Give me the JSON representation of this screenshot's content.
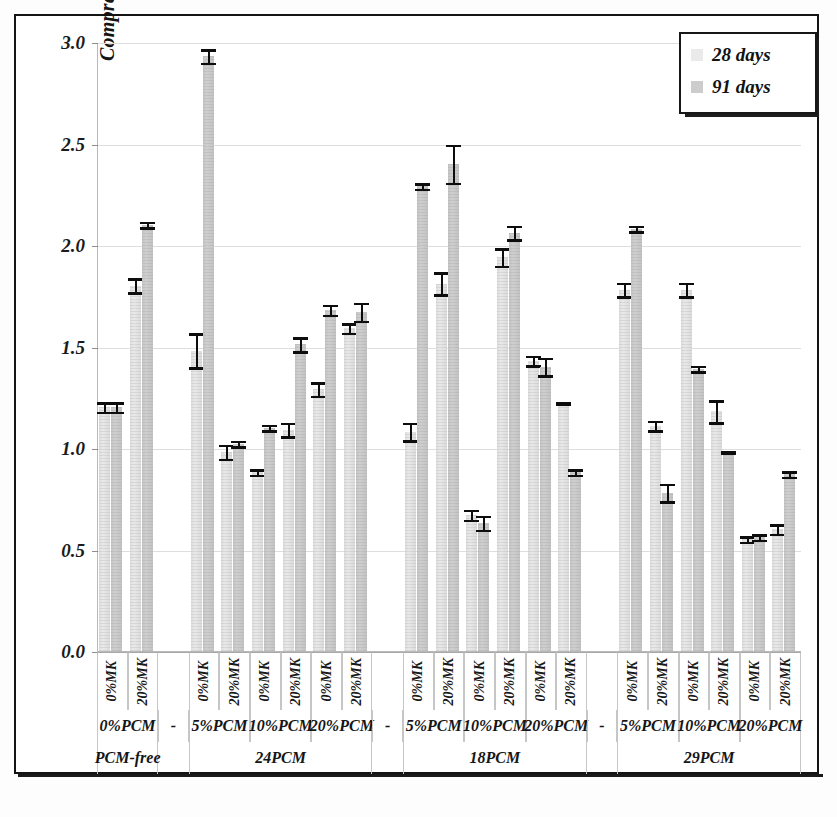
{
  "chart_data": {
    "type": "bar",
    "title": "",
    "xlabel": "",
    "ylabel": "Compresive strength (MPa)",
    "ylim": [
      0.0,
      3.0
    ],
    "ytick_labels": [
      "3.0",
      "2.5",
      "2.0",
      "1.5",
      "1.0",
      "0.5",
      "0.0"
    ],
    "ytick_values": [
      3.0,
      2.5,
      2.0,
      1.5,
      1.0,
      0.5,
      0.0
    ],
    "grid": true,
    "legend_position": "top-right",
    "legend": [
      {
        "name": "28 days",
        "color": "#eaeaea"
      },
      {
        "name": "91 days",
        "color": "#cccccc"
      }
    ],
    "groups": [
      {
        "name": "PCM-free",
        "pcm_levels": [
          {
            "label": "0%PCM",
            "columns": [
              {
                "mk": "0%MK",
                "d28": 1.2,
                "d28_err": 0.03,
                "d91": 1.2,
                "d91_err": 0.03
              },
              {
                "mk": "20%MK",
                "d28": 1.8,
                "d28_err": 0.04,
                "d91": 2.1,
                "d91_err": 0.02
              }
            ]
          }
        ]
      },
      {
        "name": "24PCM",
        "pcm_levels": [
          {
            "label": "5%PCM",
            "columns": [
              {
                "mk": "0%MK",
                "d28": 1.48,
                "d28_err": 0.09,
                "d91": 2.93,
                "d91_err": 0.04
              },
              {
                "mk": "20%MK",
                "d28": 0.98,
                "d28_err": 0.04,
                "d91": 1.02,
                "d91_err": 0.02
              }
            ]
          },
          {
            "label": "10%PCM",
            "columns": [
              {
                "mk": "0%MK",
                "d28": 0.88,
                "d28_err": 0.02,
                "d91": 1.1,
                "d91_err": 0.02
              },
              {
                "mk": "20%MK",
                "d28": 1.09,
                "d28_err": 0.04,
                "d91": 1.51,
                "d91_err": 0.04
              }
            ]
          },
          {
            "label": "20%PCM",
            "columns": [
              {
                "mk": "0%MK",
                "d28": 1.29,
                "d28_err": 0.04,
                "d91": 1.68,
                "d91_err": 0.03
              },
              {
                "mk": "20%MK",
                "d28": 1.59,
                "d28_err": 0.03,
                "d91": 1.67,
                "d91_err": 0.05
              }
            ]
          }
        ]
      },
      {
        "name": "18PCM",
        "pcm_levels": [
          {
            "label": "5%PCM",
            "columns": [
              {
                "mk": "0%MK",
                "d28": 1.08,
                "d28_err": 0.05,
                "d91": 2.29,
                "d91_err": 0.02
              },
              {
                "mk": "20%MK",
                "d28": 1.81,
                "d28_err": 0.06,
                "d91": 2.4,
                "d91_err": 0.1
              }
            ]
          },
          {
            "label": "10%PCM",
            "columns": [
              {
                "mk": "0%MK",
                "d28": 0.67,
                "d28_err": 0.03,
                "d91": 0.63,
                "d91_err": 0.04
              },
              {
                "mk": "20%MK",
                "d28": 1.94,
                "d28_err": 0.05,
                "d91": 2.06,
                "d91_err": 0.04
              }
            ]
          },
          {
            "label": "20%PCM",
            "columns": [
              {
                "mk": "0%MK",
                "d28": 1.43,
                "d28_err": 0.03,
                "d91": 1.4,
                "d91_err": 0.05
              },
              {
                "mk": "20%MK",
                "d28": 1.22,
                "d28_err": 0.01,
                "d91": 0.88,
                "d91_err": 0.02
              }
            ]
          }
        ]
      },
      {
        "name": "29PCM",
        "pcm_levels": [
          {
            "label": "5%PCM",
            "columns": [
              {
                "mk": "0%MK",
                "d28": 1.78,
                "d28_err": 0.04,
                "d91": 2.08,
                "d91_err": 0.02
              },
              {
                "mk": "20%MK",
                "d28": 1.11,
                "d28_err": 0.03,
                "d91": 0.78,
                "d91_err": 0.05
              }
            ]
          },
          {
            "label": "10%PCM",
            "columns": [
              {
                "mk": "0%MK",
                "d28": 1.78,
                "d28_err": 0.04,
                "d91": 1.39,
                "d91_err": 0.02
              },
              {
                "mk": "20%MK",
                "d28": 1.18,
                "d28_err": 0.06,
                "d91": 0.98,
                "d91_err": 0.01
              }
            ]
          },
          {
            "label": "20%PCM",
            "columns": [
              {
                "mk": "0%MK",
                "d28": 0.55,
                "d28_err": 0.02,
                "d91": 0.56,
                "d91_err": 0.02
              },
              {
                "mk": "20%MK",
                "d28": 0.6,
                "d28_err": 0.03,
                "d91": 0.87,
                "d91_err": 0.02
              }
            ]
          }
        ]
      }
    ],
    "separator_label": "-"
  },
  "colors": {
    "bar_28": "#eaeaea",
    "bar_91": "#cccccc",
    "error": "#0d0d0d",
    "grid": "#dedede",
    "axis": "#b9b9b9",
    "text": "#141414"
  }
}
